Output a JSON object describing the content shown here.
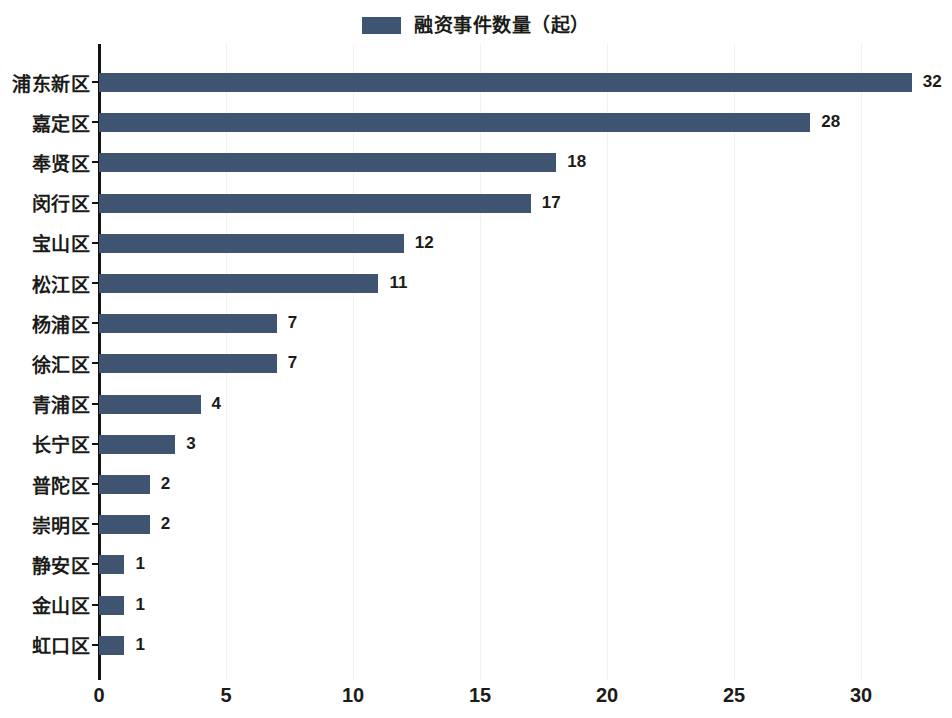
{
  "legend": {
    "entries": [
      {
        "label": "融资事件数量（起）",
        "color": "#3e5470",
        "swatch_icon": "legend-color-swatch"
      }
    ]
  },
  "chart_data": {
    "type": "bar",
    "orientation": "horizontal",
    "title": "",
    "subtitle": "",
    "xlabel": "",
    "ylabel": "",
    "xlim": [
      0,
      33
    ],
    "xticks": [
      "0",
      "5",
      "10",
      "15",
      "20",
      "25",
      "30"
    ],
    "xtick_values": [
      0,
      5,
      10,
      15,
      20,
      25,
      30
    ],
    "grid": "vertical-faint",
    "legend_position": "top-center",
    "bar_color": "#3e5470",
    "series_name": "融资事件数量（起）",
    "categories": [
      "浦东新区",
      "嘉定区",
      "奉贤区",
      "闵行区",
      "宝山区",
      "松江区",
      "杨浦区",
      "徐汇区",
      "青浦区",
      "长宁区",
      "普陀区",
      "崇明区",
      "静安区",
      "金山区",
      "虹口区"
    ],
    "values": [
      32,
      28,
      18,
      17,
      12,
      11,
      7,
      7,
      4,
      3,
      2,
      2,
      1,
      1,
      1
    ],
    "data_labels": [
      "32",
      "28",
      "18",
      "17",
      "12",
      "11",
      "7",
      "7",
      "4",
      "3",
      "2",
      "2",
      "1",
      "1",
      "1"
    ]
  }
}
